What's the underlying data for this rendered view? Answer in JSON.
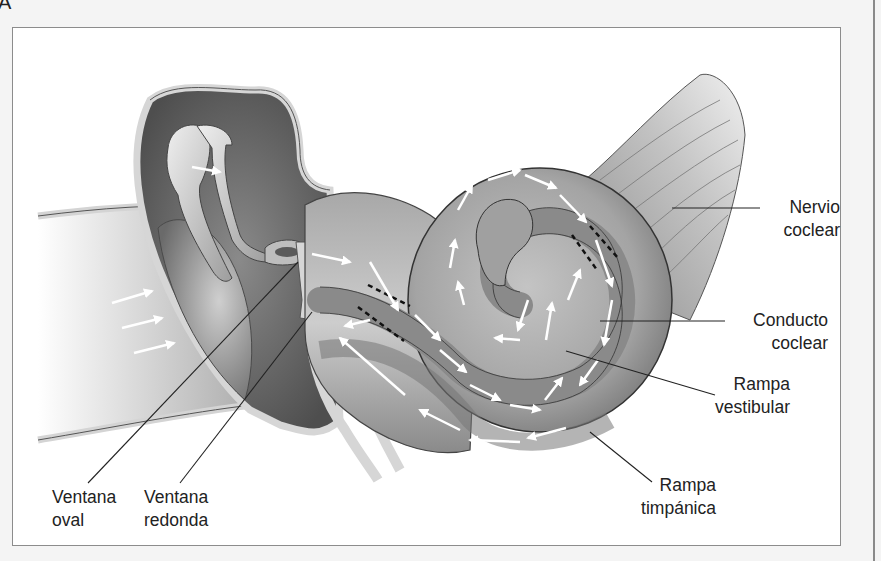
{
  "figure": {
    "panel_letter": "A",
    "background": "#f4f4f4",
    "frame_color": "#8c8c8c"
  },
  "labels": {
    "nervio_coclear": {
      "line1": "Nervio",
      "line2": "coclear"
    },
    "conducto_coclear": {
      "line1": "Conducto",
      "line2": "coclear"
    },
    "rampa_vestibular": {
      "line1": "Rampa",
      "line2": "vestibular"
    },
    "rampa_timpanica": {
      "line1": "Rampa",
      "line2": "timpánica"
    },
    "ventana_oval": {
      "line1": "Ventana",
      "line2": "oval"
    },
    "ventana_redonda": {
      "line1": "Ventana",
      "line2": "redonda"
    }
  },
  "structures": [
    "ear-canal",
    "tympanic-membrane",
    "middle-ear-cavity",
    "malleus",
    "incus",
    "stapes",
    "round-window",
    "cochlea",
    "scala-vestibuli",
    "cochlear-duct",
    "scala-tympani",
    "cochlear-nerve"
  ],
  "colors": {
    "tissue_dark": "#5e5e5e",
    "tissue_mid": "#9a9a9a",
    "tissue_light": "#c9c9c9",
    "bone": "#d9d9d9",
    "arrow": "#ffffff",
    "leader_line": "#222222"
  }
}
